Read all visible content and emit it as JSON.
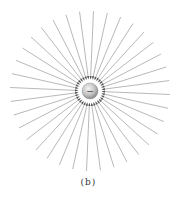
{
  "figure": {
    "caption": "(b)",
    "charge": {
      "sign": "-",
      "label": "−",
      "center": [
        90,
        91
      ],
      "radius": 8,
      "fill": "#c8c8c8",
      "highlight": "#f2f2f2"
    },
    "field_lines": {
      "count": 36,
      "inner_radius": 13,
      "outer_radius": 80,
      "color": "#9a9a9a",
      "direction": "inward",
      "arrow_color": "#555555"
    }
  }
}
